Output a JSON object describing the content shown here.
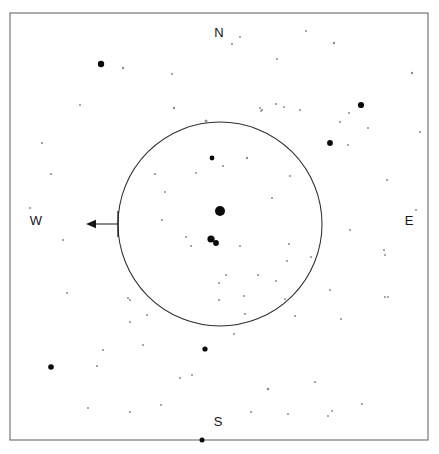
{
  "chart": {
    "width": 439,
    "height": 454,
    "background_color": "#ffffff",
    "frame": {
      "x": 10,
      "y": 13,
      "width": 418,
      "height": 427,
      "stroke_color": "#6a6a6a",
      "stroke_width": 1.1
    }
  },
  "cardinal_labels": [
    {
      "name": "north",
      "label": "N",
      "x": 219,
      "y": 34
    },
    {
      "name": "east",
      "label": "E",
      "x": 409,
      "y": 222
    },
    {
      "name": "south",
      "label": "S",
      "x": 218,
      "y": 423
    },
    {
      "name": "west",
      "label": "W",
      "x": 36,
      "y": 222
    }
  ],
  "fov_circle": {
    "name": "field-of-view-circle",
    "center_x": 220,
    "center_y": 224,
    "radius": 102,
    "stroke_color": "#2e2e2e",
    "stroke_width": 1.05
  },
  "direction_arrow": {
    "name": "west-direction-arrow",
    "points_toward": "W",
    "tail_x": 118,
    "tail_y": 224,
    "head_x": 86,
    "head_y": 224,
    "stem_top_y": 211,
    "color": "#161616"
  },
  "chart_data": {
    "type": "scatter",
    "xlabel": "",
    "ylabel": "",
    "xlim": [
      10,
      428
    ],
    "ylim": [
      13,
      440
    ],
    "grid": false,
    "legend": null,
    "annotations": [
      "N",
      "E",
      "S",
      "W"
    ],
    "series": [
      {
        "name": "stars",
        "note": "x,y are pixel positions in chart space; r is drawn marker radius scaling with brightness",
        "points": [
          {
            "x": 220,
            "y": 211,
            "r": 5.0,
            "tone": "#0a0a0a"
          },
          {
            "x": 211,
            "y": 239,
            "r": 3.6,
            "tone": "#0a0a0a"
          },
          {
            "x": 216,
            "y": 243,
            "r": 2.9,
            "tone": "#0a0a0a"
          },
          {
            "x": 101,
            "y": 64,
            "r": 3.2,
            "tone": "#0a0a0a"
          },
          {
            "x": 361,
            "y": 105,
            "r": 3.1,
            "tone": "#0a0a0a"
          },
          {
            "x": 330,
            "y": 143,
            "r": 2.9,
            "tone": "#0a0a0a"
          },
          {
            "x": 51,
            "y": 367,
            "r": 2.8,
            "tone": "#0a0a0a"
          },
          {
            "x": 205,
            "y": 349,
            "r": 2.6,
            "tone": "#0a0a0a"
          },
          {
            "x": 202,
            "y": 440,
            "r": 2.5,
            "tone": "#0a0a0a"
          },
          {
            "x": 212,
            "y": 158,
            "r": 2.4,
            "tone": "#0a0a0a"
          },
          {
            "x": 206,
            "y": 121,
            "r": 1.5,
            "tone": "#4a4a4a"
          },
          {
            "x": 123,
            "y": 68,
            "r": 1.2,
            "tone": "#6f6f6f"
          },
          {
            "x": 174,
            "y": 108,
            "r": 1.2,
            "tone": "#6f6f6f"
          },
          {
            "x": 232,
            "y": 44,
            "r": 1.1,
            "tone": "#7a7a7a"
          },
          {
            "x": 334,
            "y": 43,
            "r": 1.2,
            "tone": "#6f6f6f"
          },
          {
            "x": 412,
            "y": 73,
            "r": 1.2,
            "tone": "#6f6f6f"
          },
          {
            "x": 276,
            "y": 104,
            "r": 1.1,
            "tone": "#7a7a7a"
          },
          {
            "x": 284,
            "y": 107,
            "r": 1.0,
            "tone": "#8d8d8d"
          },
          {
            "x": 300,
            "y": 110,
            "r": 1.0,
            "tone": "#8d8d8d"
          },
          {
            "x": 262,
            "y": 110,
            "r": 1.1,
            "tone": "#7a7a7a"
          },
          {
            "x": 261,
            "y": 111,
            "r": 1.0,
            "tone": "#8d8d8d"
          },
          {
            "x": 340,
            "y": 122,
            "r": 1.0,
            "tone": "#8d8d8d"
          },
          {
            "x": 368,
            "y": 128,
            "r": 1.1,
            "tone": "#7a7a7a"
          },
          {
            "x": 42,
            "y": 143,
            "r": 1.1,
            "tone": "#7a7a7a"
          },
          {
            "x": 260,
            "y": 108,
            "r": 1.0,
            "tone": "#8d8d8d"
          },
          {
            "x": 247,
            "y": 158,
            "r": 1.2,
            "tone": "#6f6f6f"
          },
          {
            "x": 155,
            "y": 174,
            "r": 1.1,
            "tone": "#7a7a7a"
          },
          {
            "x": 51,
            "y": 174,
            "r": 1.1,
            "tone": "#7a7a7a"
          },
          {
            "x": 162,
            "y": 220,
            "r": 1.0,
            "tone": "#8d8d8d"
          },
          {
            "x": 165,
            "y": 192,
            "r": 1.0,
            "tone": "#8d8d8d"
          },
          {
            "x": 290,
            "y": 176,
            "r": 1.0,
            "tone": "#8d8d8d"
          },
          {
            "x": 272,
            "y": 198,
            "r": 1.1,
            "tone": "#7a7a7a"
          },
          {
            "x": 348,
            "y": 145,
            "r": 1.0,
            "tone": "#8d8d8d"
          },
          {
            "x": 223,
            "y": 166,
            "r": 1.1,
            "tone": "#7a7a7a"
          },
          {
            "x": 186,
            "y": 237,
            "r": 1.0,
            "tone": "#8d8d8d"
          },
          {
            "x": 240,
            "y": 246,
            "r": 1.0,
            "tone": "#8d8d8d"
          },
          {
            "x": 289,
            "y": 244,
            "r": 1.1,
            "tone": "#7a7a7a"
          },
          {
            "x": 287,
            "y": 261,
            "r": 1.0,
            "tone": "#8d8d8d"
          },
          {
            "x": 311,
            "y": 257,
            "r": 1.0,
            "tone": "#8d8d8d"
          },
          {
            "x": 258,
            "y": 275,
            "r": 1.1,
            "tone": "#7a7a7a"
          },
          {
            "x": 276,
            "y": 281,
            "r": 1.0,
            "tone": "#8d8d8d"
          },
          {
            "x": 226,
            "y": 275,
            "r": 1.0,
            "tone": "#8d8d8d"
          },
          {
            "x": 244,
            "y": 296,
            "r": 1.0,
            "tone": "#8d8d8d"
          },
          {
            "x": 285,
            "y": 299,
            "r": 1.0,
            "tone": "#8d8d8d"
          },
          {
            "x": 295,
            "y": 316,
            "r": 1.0,
            "tone": "#8d8d8d"
          },
          {
            "x": 330,
            "y": 290,
            "r": 1.0,
            "tone": "#8d8d8d"
          },
          {
            "x": 385,
            "y": 297,
            "r": 1.0,
            "tone": "#8d8d8d"
          },
          {
            "x": 384,
            "y": 250,
            "r": 1.1,
            "tone": "#7a7a7a"
          },
          {
            "x": 385,
            "y": 255,
            "r": 1.0,
            "tone": "#8d8d8d"
          },
          {
            "x": 388,
            "y": 297,
            "r": 1.0,
            "tone": "#8d8d8d"
          },
          {
            "x": 128,
            "y": 298,
            "r": 1.1,
            "tone": "#7a7a7a"
          },
          {
            "x": 130,
            "y": 300,
            "r": 1.0,
            "tone": "#8d8d8d"
          },
          {
            "x": 130,
            "y": 322,
            "r": 1.0,
            "tone": "#8d8d8d"
          },
          {
            "x": 147,
            "y": 315,
            "r": 1.0,
            "tone": "#8d8d8d"
          },
          {
            "x": 103,
            "y": 350,
            "r": 1.1,
            "tone": "#7a7a7a"
          },
          {
            "x": 143,
            "y": 345,
            "r": 1.0,
            "tone": "#8d8d8d"
          },
          {
            "x": 97,
            "y": 366,
            "r": 1.1,
            "tone": "#7a7a7a"
          },
          {
            "x": 192,
            "y": 375,
            "r": 1.0,
            "tone": "#8d8d8d"
          },
          {
            "x": 180,
            "y": 378,
            "r": 1.0,
            "tone": "#8d8d8d"
          },
          {
            "x": 161,
            "y": 405,
            "r": 1.0,
            "tone": "#8d8d8d"
          },
          {
            "x": 88,
            "y": 408,
            "r": 1.1,
            "tone": "#7a7a7a"
          },
          {
            "x": 130,
            "y": 412,
            "r": 1.0,
            "tone": "#8d8d8d"
          },
          {
            "x": 251,
            "y": 412,
            "r": 1.0,
            "tone": "#8d8d8d"
          },
          {
            "x": 288,
            "y": 414,
            "r": 1.0,
            "tone": "#8d8d8d"
          },
          {
            "x": 315,
            "y": 382,
            "r": 1.0,
            "tone": "#8d8d8d"
          },
          {
            "x": 328,
            "y": 416,
            "r": 1.0,
            "tone": "#8d8d8d"
          },
          {
            "x": 362,
            "y": 404,
            "r": 1.0,
            "tone": "#8d8d8d"
          },
          {
            "x": 332,
            "y": 411,
            "r": 1.0,
            "tone": "#8d8d8d"
          },
          {
            "x": 268,
            "y": 389,
            "r": 1.3,
            "tone": "#6f6f6f"
          },
          {
            "x": 245,
            "y": 314,
            "r": 1.0,
            "tone": "#8d8d8d"
          },
          {
            "x": 219,
            "y": 300,
            "r": 1.0,
            "tone": "#8d8d8d"
          },
          {
            "x": 219,
            "y": 283,
            "r": 1.0,
            "tone": "#8d8d8d"
          },
          {
            "x": 234,
            "y": 334,
            "r": 1.0,
            "tone": "#8d8d8d"
          },
          {
            "x": 341,
            "y": 319,
            "r": 1.0,
            "tone": "#8d8d8d"
          },
          {
            "x": 416,
            "y": 210,
            "r": 1.0,
            "tone": "#8d8d8d"
          },
          {
            "x": 349,
            "y": 113,
            "r": 1.0,
            "tone": "#8d8d8d"
          },
          {
            "x": 240,
            "y": 37,
            "r": 1.0,
            "tone": "#8d8d8d"
          },
          {
            "x": 277,
            "y": 59,
            "r": 1.0,
            "tone": "#8d8d8d"
          },
          {
            "x": 420,
            "y": 132,
            "r": 1.0,
            "tone": "#8d8d8d"
          },
          {
            "x": 30,
            "y": 208,
            "r": 1.0,
            "tone": "#8d8d8d"
          },
          {
            "x": 63,
            "y": 240,
            "r": 1.0,
            "tone": "#8d8d8d"
          },
          {
            "x": 350,
            "y": 230,
            "r": 1.0,
            "tone": "#8d8d8d"
          },
          {
            "x": 387,
            "y": 180,
            "r": 1.0,
            "tone": "#8d8d8d"
          },
          {
            "x": 306,
            "y": 31,
            "r": 1.0,
            "tone": "#8d8d8d"
          },
          {
            "x": 172,
            "y": 74,
            "r": 1.0,
            "tone": "#8d8d8d"
          },
          {
            "x": 80,
            "y": 105,
            "r": 1.0,
            "tone": "#8d8d8d"
          },
          {
            "x": 67,
            "y": 293,
            "r": 1.0,
            "tone": "#8d8d8d"
          },
          {
            "x": 191,
            "y": 246,
            "r": 1.0,
            "tone": "#8d8d8d"
          },
          {
            "x": 196,
            "y": 173,
            "r": 1.0,
            "tone": "#8d8d8d"
          }
        ]
      }
    ]
  }
}
